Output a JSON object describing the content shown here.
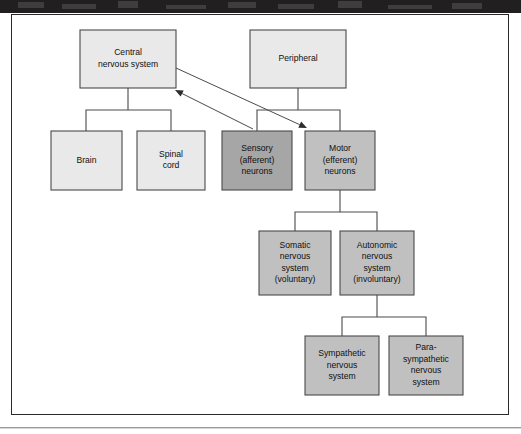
{
  "figure": {
    "frame": {
      "x": 11,
      "y": 14,
      "width": 498,
      "height": 401
    }
  },
  "colors": {
    "box_light": "#e9e9e9",
    "box_medium": "#c0c0c0",
    "box_dark": "#a6a6a6",
    "box_stroke": "#4a4a4a",
    "connector": "#4a4a4a",
    "arrow_head": "#2c2c2c",
    "frame_stroke": "#2a2a2a",
    "text": "#101010",
    "scan_band": "#211f20"
  },
  "nodes": [
    {
      "id": "central-nervous-system",
      "name": "node-central-nervous-system",
      "lines": [
        "Central",
        "nervous system"
      ],
      "x": 80,
      "y": 30,
      "width": 96,
      "height": 58,
      "fill": "#e9e9e9"
    },
    {
      "id": "peripheral",
      "name": "node-peripheral",
      "lines": [
        "Peripheral"
      ],
      "x": 250,
      "y": 30,
      "width": 96,
      "height": 58,
      "fill": "#e9e9e9"
    },
    {
      "id": "brain",
      "name": "node-brain",
      "lines": [
        "Brain"
      ],
      "x": 51,
      "y": 131,
      "width": 71,
      "height": 59,
      "fill": "#e9e9e9"
    },
    {
      "id": "spinal-cord",
      "name": "node-spinal-cord",
      "lines": [
        "Spinal",
        "cord"
      ],
      "x": 137,
      "y": 131,
      "width": 68,
      "height": 59,
      "fill": "#e9e9e9"
    },
    {
      "id": "sensory-afferent-neurons",
      "name": "node-sensory-afferent-neurons",
      "lines": [
        "Sensory",
        "(afferent)",
        "neurons"
      ],
      "x": 222,
      "y": 131,
      "width": 70,
      "height": 59,
      "fill": "#a6a6a6"
    },
    {
      "id": "motor-efferent-neurons",
      "name": "node-motor-efferent-neurons",
      "lines": [
        "Motor",
        "(efferent)",
        "neurons"
      ],
      "x": 305,
      "y": 131,
      "width": 70,
      "height": 59,
      "fill": "#c0c0c0"
    },
    {
      "id": "somatic-nervous-system",
      "name": "node-somatic-nervous-system",
      "lines": [
        "Somatic",
        "nervous",
        "system",
        "(voluntary)"
      ],
      "x": 259,
      "y": 231,
      "width": 72,
      "height": 64,
      "fill": "#c0c0c0"
    },
    {
      "id": "autonomic-nervous-system",
      "name": "node-autonomic-nervous-system",
      "lines": [
        "Autonomic",
        "nervous",
        "system",
        "(involuntary)"
      ],
      "x": 340,
      "y": 231,
      "width": 74,
      "height": 64,
      "fill": "#c0c0c0"
    },
    {
      "id": "sympathetic-nervous-system",
      "name": "node-sympathetic-nervous-system",
      "lines": [
        "Sympathetic",
        "nervous",
        "system"
      ],
      "x": 305,
      "y": 336,
      "width": 74,
      "height": 59,
      "fill": "#c0c0c0"
    },
    {
      "id": "parasympathetic-nervous-system",
      "name": "node-parasympathetic-nervous-system",
      "lines": [
        "Para-",
        "sympathetic",
        "nervous",
        "system"
      ],
      "x": 389,
      "y": 336,
      "width": 74,
      "height": 59,
      "fill": "#c0c0c0"
    }
  ],
  "connectors": [
    {
      "id": "cns-to-children",
      "name": "connector-cns-to-brain-and-spinal-cord",
      "from": "central-nervous-system",
      "to": [
        "brain",
        "spinal-cord"
      ],
      "points": "128,88 128,110 86,110 86,131 M128,110 171,110 171,131"
    },
    {
      "id": "peripheral-to-children",
      "name": "connector-peripheral-to-sensory-and-motor",
      "from": "peripheral",
      "to": [
        "sensory-afferent-neurons",
        "motor-efferent-neurons"
      ],
      "points": "298,88 298,110 257,110 257,131 M298,110 340,110 340,131"
    },
    {
      "id": "motor-to-children",
      "name": "connector-motor-to-somatic-and-autonomic",
      "from": "motor-efferent-neurons",
      "to": [
        "somatic-nervous-system",
        "autonomic-nervous-system"
      ],
      "points": "340,190 340,212 295,212 295,231 M340,212 377,212 377,231"
    },
    {
      "id": "autonomic-to-children",
      "name": "connector-autonomic-to-sympathetic-and-parasympathetic",
      "from": "autonomic-nervous-system",
      "to": [
        "sympathetic-nervous-system",
        "parasympathetic-nervous-system"
      ],
      "points": "377,295 377,317 342,317 342,336 M377,317 426,317 426,336"
    }
  ],
  "flow_arrows": [
    {
      "id": "cns-to-motor",
      "name": "arrow-cns-to-motor-neurons",
      "direction": "efferent",
      "from": "central-nervous-system",
      "to": "motor-efferent-neurons",
      "x1": 176,
      "y1": 68,
      "x2": 307,
      "y2": 128
    },
    {
      "id": "sensory-to-cns",
      "name": "arrow-sensory-neurons-to-cns",
      "direction": "afferent",
      "from": "sensory-afferent-neurons",
      "to": "central-nervous-system",
      "x1": 253,
      "y1": 129,
      "x2": 175,
      "y2": 90
    }
  ]
}
